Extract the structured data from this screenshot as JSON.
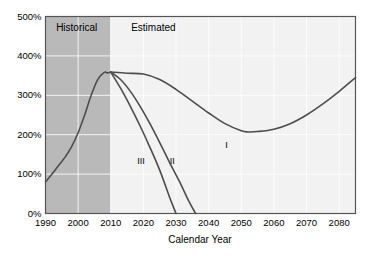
{
  "chart_data": {
    "type": "line",
    "title": "",
    "xlabel": "Calendar Year",
    "ylabel": "",
    "xlim": [
      1990,
      2085
    ],
    "ylim": [
      0,
      500
    ],
    "grid": true,
    "legend_position": "inline-annotations",
    "x_ticks": [
      "1990",
      "2000",
      "2010",
      "2020",
      "2030",
      "2040",
      "2050",
      "2060",
      "2070",
      "2080"
    ],
    "x_tick_values": [
      1990,
      2000,
      2010,
      2020,
      2030,
      2040,
      2050,
      2060,
      2070,
      2080
    ],
    "y_ticks": [
      "0%",
      "100%",
      "200%",
      "300%",
      "400%",
      "500%"
    ],
    "y_tick_values": [
      0,
      100,
      200,
      300,
      400,
      500
    ],
    "shaded_regions": [
      {
        "name": "Historical",
        "x_start": 1990,
        "x_end": 2010,
        "color": "#b9b9b9"
      },
      {
        "name": "Estimated",
        "x_start": 2010,
        "x_end": 2085,
        "color": "#f2f2f2"
      }
    ],
    "region_labels": [
      {
        "text": "Historical",
        "x": 2000,
        "y": 468
      },
      {
        "text": "Estimated",
        "x": 2023,
        "y": 468
      }
    ],
    "series": [
      {
        "name": "Historical",
        "label": "",
        "color": "#4d4d4d",
        "x": [
          1990,
          1992,
          1994,
          1996,
          1998,
          2000,
          2002,
          2004,
          2006,
          2008,
          2009,
          2010
        ],
        "values": [
          80,
          100,
          122,
          143,
          170,
          205,
          250,
          300,
          340,
          358,
          357,
          359
        ]
      },
      {
        "name": "I",
        "label": "I",
        "color": "#4d4d4d",
        "label_x": 2046,
        "label_y": 172,
        "x": [
          2010,
          2015,
          2020,
          2025,
          2030,
          2035,
          2040,
          2045,
          2050,
          2052,
          2055,
          2060,
          2065,
          2070,
          2075,
          2080,
          2085
        ],
        "values": [
          359,
          356,
          354,
          340,
          315,
          285,
          255,
          228,
          210,
          207,
          208,
          214,
          228,
          250,
          278,
          310,
          345
        ]
      },
      {
        "name": "II",
        "label": "II",
        "color": "#4d4d4d",
        "label_x": 2029,
        "label_y": 130,
        "x": [
          2010,
          2013,
          2016,
          2019,
          2022,
          2025,
          2028,
          2031,
          2034,
          2036
        ],
        "values": [
          359,
          340,
          310,
          272,
          228,
          180,
          130,
          82,
          30,
          0
        ]
      },
      {
        "name": "III",
        "label": "III",
        "color": "#4d4d4d",
        "label_x": 2019,
        "label_y": 130,
        "x": [
          2010,
          2013,
          2016,
          2019,
          2022,
          2025,
          2028,
          2030
        ],
        "values": [
          359,
          318,
          272,
          222,
          168,
          110,
          42,
          0
        ]
      }
    ]
  },
  "axis": {
    "x_title": "Calendar Year"
  }
}
